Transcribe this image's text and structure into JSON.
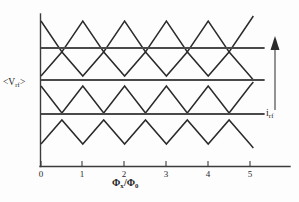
{
  "figure": {
    "type": "line",
    "background_color": "#fdfdfd",
    "line_color": "#2a2a2a",
    "flat_line_color": "#4a4a4a"
  },
  "axes": {
    "x_title_prefix": "Φ",
    "x_title_sub1": "x",
    "x_title_mid": "/Φ",
    "x_title_sub2": "0",
    "y_title_open": "<V",
    "y_title_sub": "rf",
    "y_title_close": ">",
    "x_ticks": [
      "0",
      "1",
      "2",
      "3",
      "4",
      "5"
    ],
    "x_tick_values": [
      0,
      1,
      2,
      3,
      4,
      5
    ],
    "xlim": [
      0,
      5.35
    ],
    "ylim": [
      0,
      1
    ],
    "y_ticks": [],
    "grid": false
  },
  "annotations": {
    "current_arrow_label_main": "i",
    "current_arrow_label_sub": "rf",
    "current_arrow_direction": "up"
  },
  "chart_data": {
    "type": "line",
    "title": "",
    "xlabel": "Φx/Φ0",
    "ylabel": "<Vrf>",
    "xlim": [
      0,
      5.35
    ],
    "ylim": [
      0,
      202
    ],
    "grid": false,
    "legend": "none",
    "x_ticks": [
      0,
      1,
      2,
      3,
      4,
      5
    ],
    "series": [
      {
        "name": "triangle-wave-1",
        "kind": "triangle",
        "start_phase": "peak",
        "period": 1.0,
        "amplitude_px": 17,
        "baseline_px": 35,
        "x_start": 0.0,
        "x_end": 5.08,
        "vertices_x": [
          0.0,
          0.5,
          1.0,
          1.5,
          2.0,
          2.5,
          3.0,
          3.5,
          4.0,
          4.5,
          5.0,
          5.08
        ],
        "vertices_y_px": [
          21,
          52,
          21,
          52,
          21,
          52,
          21,
          52,
          21,
          52,
          21,
          16
        ]
      },
      {
        "name": "flat-line-1",
        "kind": "flat",
        "y_px": 48,
        "x_start": 0.0,
        "x_end": 5.35
      },
      {
        "name": "triangle-wave-2",
        "kind": "triangle",
        "start_phase": "valley",
        "period": 1.0,
        "amplitude_px": 16,
        "baseline_px": 68,
        "x_start": 0.0,
        "x_end": 5.08,
        "vertices_x": [
          0.0,
          0.5,
          1.0,
          1.5,
          2.0,
          2.5,
          3.0,
          3.5,
          4.0,
          4.5,
          5.0,
          5.08
        ],
        "vertices_y_px": [
          76,
          52,
          76,
          52,
          76,
          52,
          76,
          52,
          76,
          52,
          76,
          80
        ]
      },
      {
        "name": "flat-line-2",
        "kind": "flat",
        "y_px": 80,
        "x_start": 0.0,
        "x_end": 5.35
      },
      {
        "name": "triangle-wave-3",
        "kind": "triangle",
        "start_phase": "peak",
        "period": 1.0,
        "amplitude_px": 17,
        "baseline_px": 100,
        "x_start": 0.0,
        "x_end": 5.08,
        "vertices_x": [
          0.0,
          0.5,
          1.0,
          1.5,
          2.0,
          2.5,
          3.0,
          3.5,
          4.0,
          4.5,
          5.0,
          5.08
        ],
        "vertices_y_px": [
          86,
          113,
          86,
          113,
          86,
          113,
          86,
          113,
          86,
          113,
          86,
          82
        ]
      },
      {
        "name": "flat-line-3",
        "kind": "flat",
        "y_px": 114,
        "x_start": 0.0,
        "x_end": 5.35
      },
      {
        "name": "triangle-wave-4",
        "kind": "triangle",
        "start_phase": "valley",
        "period": 1.0,
        "amplitude_px": 17,
        "baseline_px": 135,
        "x_start": 0.0,
        "x_end": 5.08,
        "vertices_x": [
          0.0,
          0.5,
          1.0,
          1.5,
          2.0,
          2.5,
          3.0,
          3.5,
          4.0,
          4.5,
          5.0,
          5.08
        ],
        "vertices_y_px": [
          144,
          120,
          144,
          120,
          144,
          120,
          144,
          120,
          144,
          120,
          144,
          148
        ]
      }
    ]
  }
}
